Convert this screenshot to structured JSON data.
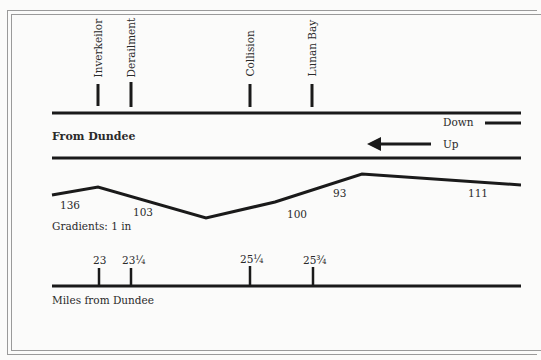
{
  "diagram": {
    "stations": [
      {
        "name": "Inverkeilor",
        "x": 98
      },
      {
        "name": "Derailment",
        "x": 131
      },
      {
        "name": "Collision",
        "x": 250
      },
      {
        "name": "Lunan Bay",
        "x": 312
      }
    ],
    "track_label": "From Dundee",
    "directions": {
      "down": "Down",
      "up": "Up"
    },
    "gradients": {
      "caption": "Gradients: 1 in",
      "profile_points": [
        [
          52,
          195
        ],
        [
          98,
          187
        ],
        [
          206,
          218
        ],
        [
          275,
          202
        ],
        [
          362,
          174
        ],
        [
          521,
          185
        ]
      ],
      "values": [
        {
          "label": "136",
          "x": 60,
          "y": 200
        },
        {
          "label": "103",
          "x": 133,
          "y": 207
        },
        {
          "label": "100",
          "x": 287,
          "y": 209
        },
        {
          "label": "93",
          "x": 333,
          "y": 188
        },
        {
          "label": "111",
          "x": 468,
          "y": 188
        }
      ]
    },
    "mileposts": {
      "caption": "Miles from Dundee",
      "ticks": [
        {
          "label": "23",
          "x": 99
        },
        {
          "label": "23¼",
          "x": 131
        },
        {
          "label": "25¼",
          "x": 250
        },
        {
          "label": "25¾",
          "x": 313
        }
      ]
    },
    "colors": {
      "ink": "#1a1a1a",
      "frame": "#9a9a9a",
      "paper": "#fbfbfa"
    }
  }
}
